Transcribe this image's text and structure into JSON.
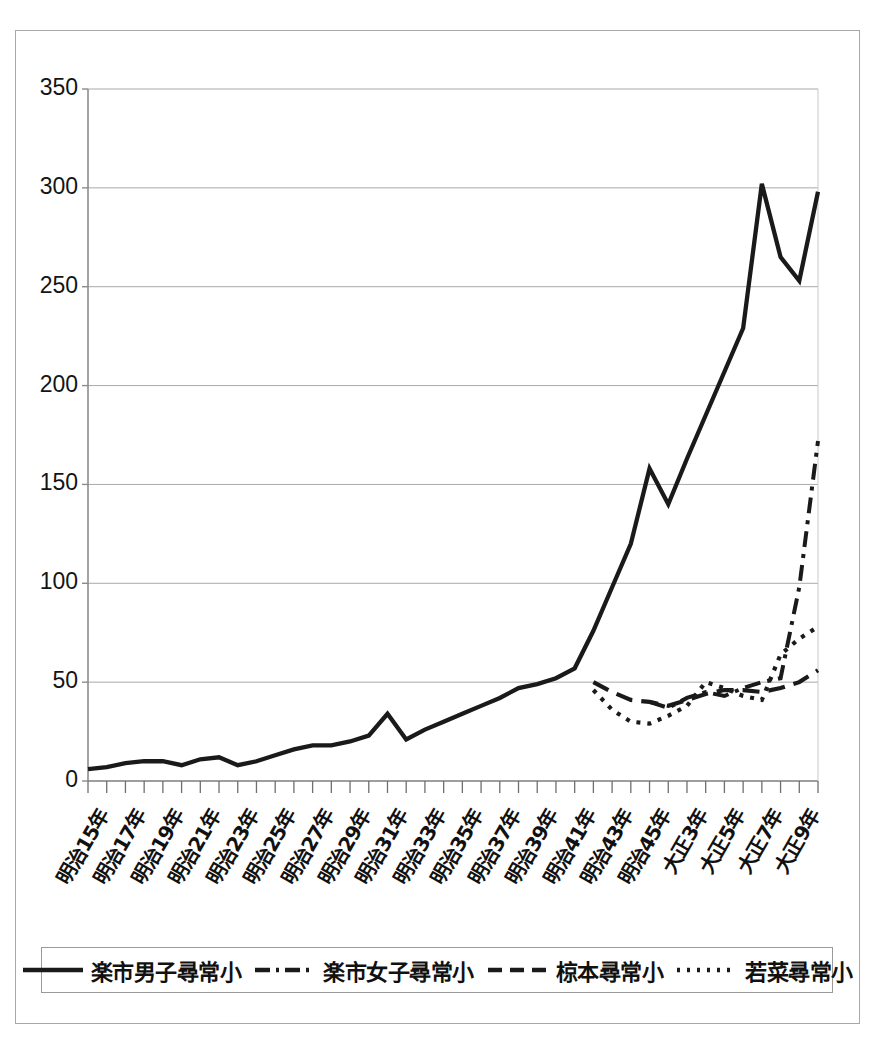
{
  "figure": {
    "title": "",
    "border_color": "#a8a8a8",
    "background": "#ffffff"
  },
  "axis": {
    "y_ticks": [
      "0",
      "50",
      "100",
      "150",
      "200",
      "250",
      "300",
      "350"
    ],
    "x_labels": [
      "明治15年",
      "明治17年",
      "明治19年",
      "明治21年",
      "明治23年",
      "明治25年",
      "明治27年",
      "明治29年",
      "明治31年",
      "明治33年",
      "明治35年",
      "明治37年",
      "明治39年",
      "明治41年",
      "明治43年",
      "明治45年",
      "大正3年",
      "大正5年",
      "大正7年",
      "大正9年"
    ]
  },
  "legend": {
    "entries": [
      {
        "label": "楽市男子尋常小",
        "style": "solid",
        "icon": "solid-line-icon"
      },
      {
        "label": "楽市女子尋常小",
        "style": "dashdot",
        "icon": "dash-dot-line-icon"
      },
      {
        "label": "椋本尋常小",
        "style": "dashed",
        "icon": "dashed-line-icon"
      },
      {
        "label": "若菜尋常小",
        "style": "dotted",
        "icon": "dotted-line-icon"
      }
    ]
  },
  "chart_data": {
    "type": "line",
    "title": "",
    "xlabel": "",
    "ylabel": "",
    "ylim": [
      0,
      350
    ],
    "ytick_step": 50,
    "grid": "horizontal",
    "legend_position": "bottom",
    "line_color": "#1a1a1a",
    "x": [
      "明治15年",
      "明治16年",
      "明治17年",
      "明治18年",
      "明治19年",
      "明治20年",
      "明治21年",
      "明治22年",
      "明治23年",
      "明治24年",
      "明治25年",
      "明治26年",
      "明治27年",
      "明治28年",
      "明治29年",
      "明治30年",
      "明治31年",
      "明治32年",
      "明治33年",
      "明治34年",
      "明治35年",
      "明治36年",
      "明治37年",
      "明治38年",
      "明治39年",
      "明治40年",
      "明治41年",
      "明治42年",
      "明治43年",
      "明治44年",
      "明治45年",
      "大正2年",
      "大正3年",
      "大正4年",
      "大正5年",
      "大正6年",
      "大正7年",
      "大正8年",
      "大正9年",
      "大正10年"
    ],
    "series": [
      {
        "name": "楽市男子尋常小",
        "style": "solid",
        "values": [
          6,
          7,
          9,
          10,
          10,
          8,
          11,
          12,
          8,
          10,
          13,
          16,
          18,
          18,
          20,
          23,
          34,
          21,
          26,
          30,
          34,
          38,
          42,
          47,
          49,
          52,
          57,
          76,
          98,
          120,
          158,
          140,
          163,
          185,
          207,
          229,
          302,
          265,
          253,
          298
        ]
      },
      {
        "name": "楽市女子尋常小",
        "style": "dashdot",
        "values": [
          null,
          null,
          null,
          null,
          null,
          null,
          null,
          null,
          null,
          null,
          null,
          null,
          null,
          null,
          null,
          null,
          null,
          null,
          null,
          null,
          null,
          null,
          null,
          null,
          null,
          null,
          null,
          null,
          null,
          null,
          40,
          37,
          42,
          45,
          43,
          47,
          50,
          52,
          98,
          172
        ]
      },
      {
        "name": "椋本尋常小",
        "style": "dashed",
        "values": [
          null,
          null,
          null,
          null,
          null,
          null,
          null,
          null,
          null,
          null,
          null,
          null,
          null,
          null,
          null,
          null,
          null,
          null,
          null,
          null,
          null,
          null,
          null,
          null,
          null,
          null,
          null,
          50,
          45,
          41,
          40,
          38,
          41,
          44,
          46,
          46,
          45,
          47,
          50,
          56
        ]
      },
      {
        "name": "若菜尋常小",
        "style": "dotted",
        "values": [
          null,
          null,
          null,
          null,
          null,
          null,
          null,
          null,
          null,
          null,
          null,
          null,
          null,
          null,
          null,
          null,
          null,
          null,
          null,
          null,
          null,
          null,
          null,
          null,
          null,
          null,
          null,
          46,
          36,
          30,
          29,
          33,
          38,
          50,
          47,
          43,
          41,
          64,
          72,
          78
        ]
      }
    ]
  }
}
